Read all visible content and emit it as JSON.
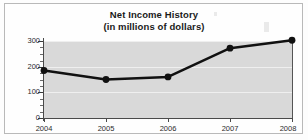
{
  "figure": {
    "title_line1": "Net Income History",
    "title_line2": "(in millions of dollars)",
    "frame_color": "#b9b9b9",
    "plot_background": "#d9d9d9",
    "gridline_color": "#efefef",
    "axis_color": "#4a4a4a",
    "series_color": "#111111"
  },
  "chart_data": {
    "type": "line",
    "title": "Net Income History (in millions of dollars)",
    "xlabel": "",
    "ylabel": "",
    "categories": [
      "2004",
      "2005",
      "2006",
      "2007",
      "2008"
    ],
    "values": [
      185,
      150,
      160,
      272,
      303
    ],
    "ylim": [
      0,
      330
    ],
    "yticks": [
      0,
      100,
      200,
      300
    ],
    "ytick_labels": [
      "0",
      "100",
      "200",
      "300"
    ],
    "xtick_labels": [
      "2004",
      "2005",
      "2006",
      "2007",
      "2008"
    ],
    "grid": true,
    "legend": null,
    "series": [
      {
        "name": "Net Income",
        "values": [
          185,
          150,
          160,
          272,
          303
        ],
        "marker": "circle",
        "color": "#111111"
      }
    ]
  }
}
